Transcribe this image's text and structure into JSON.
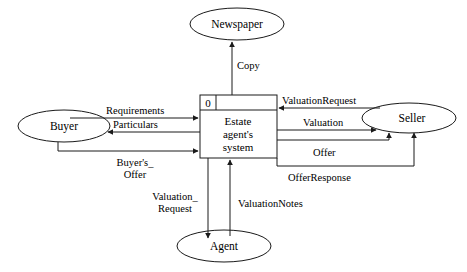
{
  "diagram": {
    "type": "data-flow-diagram",
    "canvas": {
      "width": 467,
      "height": 272
    },
    "colors": {
      "stroke": "#1a1a1a",
      "fill": "#ffffff",
      "text": "#000000",
      "background": "#ffffff"
    },
    "entities": [
      {
        "id": "newspaper",
        "label": "Newspaper",
        "shape": "ellipse",
        "cx": 237,
        "cy": 24,
        "rx": 47,
        "ry": 16
      },
      {
        "id": "buyer",
        "label": "Buyer",
        "shape": "ellipse",
        "cx": 64,
        "cy": 126,
        "rx": 46,
        "ry": 16
      },
      {
        "id": "seller",
        "label": "Seller",
        "shape": "ellipse",
        "cx": 409,
        "cy": 118,
        "rx": 47,
        "ry": 15
      },
      {
        "id": "agent",
        "label": "Agent",
        "shape": "ellipse",
        "cx": 224,
        "cy": 246,
        "rx": 47,
        "ry": 16
      }
    ],
    "process": {
      "id": "estate-agents-system",
      "number": "0",
      "name_line1": "Estate",
      "name_line2": "agent's",
      "name_line3": "system",
      "shape": "rectangle",
      "x": 200,
      "y": 95,
      "width": 77,
      "height": 63,
      "header_height": 15,
      "id_cell_width": 16
    },
    "flows": [
      {
        "id": "copy",
        "label": "Copy",
        "from": "estate-agents-system",
        "to": "newspaper",
        "label_x": 237,
        "label_y": 69,
        "anchor": "start"
      },
      {
        "id": "requirements",
        "label": "Requirements",
        "from": "buyer",
        "to": "estate-agents-system",
        "label_x": 106,
        "label_y": 114,
        "anchor": "start"
      },
      {
        "id": "particulars",
        "label": "Particulars",
        "from": "estate-agents-system",
        "to": "buyer",
        "label_x": 113,
        "label_y": 128,
        "anchor": "start"
      },
      {
        "id": "buyers-offer",
        "label_line1": "Buyer's_",
        "label_line2": "Offer",
        "from": "buyer",
        "to": "estate-agents-system",
        "label_x": 135,
        "label_y": 166,
        "anchor": "middle"
      },
      {
        "id": "valuation-request-seller",
        "label": "ValuationRequest",
        "from": "seller",
        "to": "estate-agents-system",
        "label_x": 282,
        "label_y": 104,
        "anchor": "start"
      },
      {
        "id": "valuation",
        "label": "Valuation",
        "from": "estate-agents-system",
        "to": "seller",
        "label_x": 303,
        "label_y": 126,
        "anchor": "start"
      },
      {
        "id": "offer",
        "label": "Offer",
        "from": "estate-agents-system",
        "to": "seller",
        "label_x": 313,
        "label_y": 156,
        "anchor": "start"
      },
      {
        "id": "offer-response",
        "label": "OfferResponse",
        "from": "estate-agents-system",
        "to": "seller",
        "label_x": 288,
        "label_y": 181,
        "anchor": "start"
      },
      {
        "id": "valuation-request-agent",
        "label_line1": "Valuation_",
        "label_line2": "Request",
        "from": "estate-agents-system",
        "to": "agent",
        "label_x": 175,
        "label_y": 200,
        "anchor": "middle"
      },
      {
        "id": "valuation-notes",
        "label": "ValuationNotes",
        "from": "agent",
        "to": "estate-agents-system",
        "label_x": 238,
        "label_y": 207,
        "anchor": "start"
      }
    ]
  }
}
